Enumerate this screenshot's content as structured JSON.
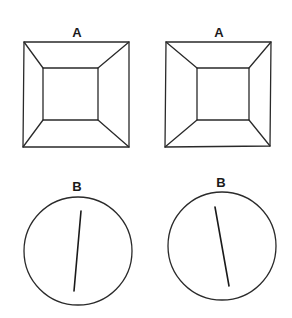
{
  "figure": {
    "type": "illusion-diagram",
    "panels": [
      {
        "id": "A-left",
        "label": "A",
        "shape": "square-frustum",
        "description": "Outer square with inner square connected by diagonal corner lines"
      },
      {
        "id": "A-right",
        "label": "A",
        "shape": "square-frustum",
        "description": "Outer square with inner square connected by diagonal corner lines"
      },
      {
        "id": "B-left",
        "label": "B",
        "shape": "circle-with-line",
        "line_tilt": "leans right (top toward right)"
      },
      {
        "id": "B-right",
        "label": "B",
        "shape": "circle-with-line",
        "line_tilt": "leans left (top toward left)"
      }
    ],
    "colors": {
      "ink": "#2a2a2a",
      "background": "#ffffff"
    }
  }
}
